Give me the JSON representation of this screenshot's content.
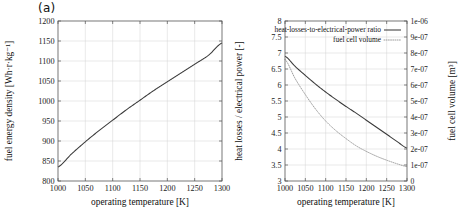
{
  "figure": {
    "panel_a_label": "(a)",
    "panel_b_label": "(b)",
    "shared_xlabel": "operating temperature [K]"
  },
  "chart_data": [
    {
      "type": "line",
      "panel": "(a)",
      "title": "",
      "xlabel": "operating temperature [K]",
      "ylabel": "fuel energy density [Wh·r·kg⁻¹]",
      "xlim": [
        1000,
        1300
      ],
      "ylim": [
        800,
        1200
      ],
      "xticks": [
        1000,
        1050,
        1100,
        1150,
        1200,
        1250,
        1300
      ],
      "xtick_labels": [
        "1000",
        "1050",
        "1100",
        "1150",
        "1200",
        "1250",
        "1300"
      ],
      "yticks": [
        800,
        850,
        900,
        950,
        1000,
        1050,
        1100,
        1150,
        1200
      ],
      "ytick_labels": [
        "800",
        "850",
        "900",
        "950",
        "1000",
        "1050",
        "1100",
        "1150",
        "1200"
      ],
      "grid": true,
      "legend": "none",
      "series": [
        {
          "name": "fuel energy density",
          "style": "solid",
          "color": "#3a3a3a",
          "x": [
            1000,
            1025,
            1050,
            1075,
            1100,
            1125,
            1150,
            1175,
            1200,
            1225,
            1250,
            1275,
            1300
          ],
          "values": [
            835,
            868,
            898,
            926,
            952,
            978,
            1002,
            1026,
            1048,
            1070,
            1092,
            1114,
            1145
          ]
        }
      ]
    },
    {
      "type": "line",
      "panel": "(b)",
      "title": "",
      "xlabel": "operating temperature [K]",
      "ylabel": "heat losses / electrical power [-]",
      "y2label": "fuel cell volume [m³]",
      "xlim": [
        1000,
        1300
      ],
      "ylim": [
        3,
        8
      ],
      "y2lim": [
        0,
        1e-06
      ],
      "xticks": [
        1000,
        1050,
        1100,
        1150,
        1200,
        1250,
        1300
      ],
      "xtick_labels": [
        "1000",
        "1050",
        "1100",
        "1150",
        "1200",
        "1250",
        "1300"
      ],
      "yticks": [
        3,
        3.5,
        4,
        4.5,
        5,
        5.5,
        6,
        6.5,
        7,
        7.5,
        8
      ],
      "ytick_labels": [
        "3",
        "3.5",
        "4",
        "4.5",
        "5",
        "5.5",
        "6",
        "6.5",
        "7",
        "7.5",
        "8"
      ],
      "y2ticks": [
        0,
        1e-07,
        2e-07,
        3e-07,
        4e-07,
        5e-07,
        6e-07,
        7e-07,
        8e-07,
        9e-07,
        1e-06
      ],
      "y2tick_labels": [
        "0",
        "1e-07",
        "2e-07",
        "3e-07",
        "4e-07",
        "5e-07",
        "6e-07",
        "7e-07",
        "8e-07",
        "9e-07",
        "1e-06"
      ],
      "grid": true,
      "legend_position": "top-right-inside",
      "series": [
        {
          "name": "heat-losses-to-electrical-power ratio",
          "style": "solid",
          "color": "#3a3a3a",
          "axis": "left",
          "x": [
            1000,
            1025,
            1050,
            1075,
            1100,
            1125,
            1150,
            1175,
            1200,
            1225,
            1250,
            1275,
            1300
          ],
          "values": [
            6.9,
            6.58,
            6.3,
            6.03,
            5.78,
            5.55,
            5.33,
            5.12,
            4.9,
            4.68,
            4.46,
            4.24,
            4.03
          ]
        },
        {
          "name": "fuel cell volume",
          "style": "dotted",
          "color": "#8d8d8d",
          "axis": "right",
          "x": [
            1000,
            1025,
            1050,
            1075,
            1100,
            1125,
            1150,
            1175,
            1200,
            1225,
            1250,
            1275,
            1300
          ],
          "values": [
            7.6e-07,
            6.4e-07,
            5.4e-07,
            4.5e-07,
            3.75e-07,
            3.15e-07,
            2.65e-07,
            2.2e-07,
            1.85e-07,
            1.55e-07,
            1.3e-07,
            1.08e-07,
            9e-08
          ]
        }
      ],
      "legend_entries": [
        "heat-losses-to-electrical-power ratio",
        "fuel cell volume"
      ]
    }
  ]
}
